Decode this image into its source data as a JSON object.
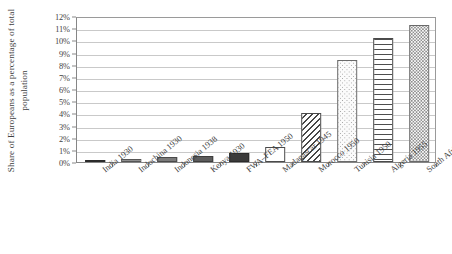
{
  "chart_data": {
    "type": "bar",
    "title": "",
    "subtitle": "",
    "xlabel": "",
    "ylabel": "Share of Europeans as a percentage of total population",
    "ylim": [
      0,
      12
    ],
    "ytick_labels": [
      "0%",
      "1%",
      "2%",
      "3%",
      "4%",
      "5%",
      "6%",
      "7%",
      "8%",
      "9%",
      "10%",
      "11%",
      "12%"
    ],
    "ytick_values": [
      0,
      1,
      2,
      3,
      4,
      5,
      6,
      7,
      8,
      9,
      10,
      11,
      12
    ],
    "grid": true,
    "legend": "none",
    "categories": [
      "India 1930",
      "Indochina 1930",
      "Indonesia 1938",
      "Kenya 1930",
      "FWA–FEA 1950",
      "Madagascar 1945",
      "Morocco 1950",
      "Tunisia 1950",
      "Algeria 1955",
      "South Africa 2010"
    ],
    "values": [
      0.1,
      0.25,
      0.45,
      0.5,
      0.7,
      1.2,
      4.0,
      8.4,
      10.2,
      11.3
    ],
    "bar_patterns": [
      "solid-dark",
      "solid-lighter",
      "solid-light",
      "solid-mid",
      "solid-dark",
      "white",
      "diagonal-hatch",
      "dots-sparse",
      "horizontal-lines",
      "dots-dense"
    ],
    "annotations": []
  },
  "axis": {
    "y_title": "Share of Europeans as a percentage of total population"
  }
}
